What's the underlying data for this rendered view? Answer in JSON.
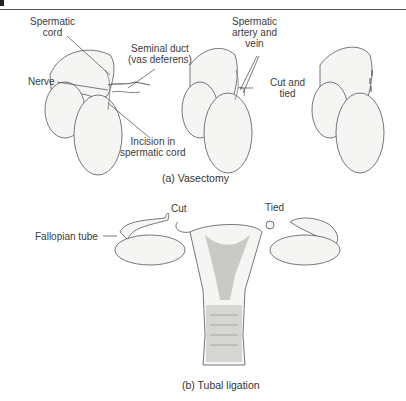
{
  "figure": {
    "panel_a": {
      "caption": "(a)  Vasectomy",
      "labels": {
        "spermatic_cord_1": "Spermatic",
        "spermatic_cord_2": "cord",
        "seminal_duct_1": "Seminal duct",
        "seminal_duct_2": "(vas deferens)",
        "nerve": "Nerve",
        "incision_1": "Incision in",
        "incision_2": "spermatic cord",
        "artery_1": "Spermatic",
        "artery_2": "artery and",
        "artery_3": "vein",
        "cut_tied_1": "Cut and",
        "cut_tied_2": "tied"
      }
    },
    "panel_b": {
      "caption": "(b)  Tubal ligation",
      "labels": {
        "cut": "Cut",
        "tied": "Tied",
        "fallopian_tube": "Fallopian tube"
      }
    },
    "colors": {
      "line": "#444444",
      "shade": "#bdbdbd",
      "fill": "#f4f4f2"
    }
  }
}
